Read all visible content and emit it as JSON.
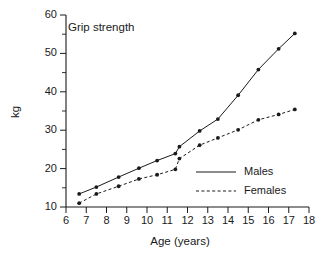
{
  "chart_data": {
    "type": "line",
    "title": "Grip strength",
    "xlabel": "Age (years)",
    "ylabel": "kg",
    "xlim": [
      6,
      18
    ],
    "ylim": [
      10,
      60
    ],
    "xticks": [
      6,
      7,
      8,
      9,
      10,
      11,
      12,
      13,
      14,
      15,
      16,
      17,
      18
    ],
    "yticks": [
      10,
      20,
      30,
      40,
      50,
      60
    ],
    "yticks_minor": [
      15,
      25,
      35,
      45,
      55
    ],
    "grid": false,
    "legend_position": "lower-right",
    "series": [
      {
        "name": "Males",
        "style": "solid",
        "x": [
          6.65,
          7.5,
          8.6,
          9.6,
          10.5,
          11.4,
          11.6,
          12.6,
          13.5,
          14.5,
          15.5,
          16.5,
          17.3
        ],
        "values": [
          13.4,
          15.2,
          17.8,
          20.1,
          22.1,
          23.9,
          25.7,
          29.8,
          32.9,
          39.1,
          45.8,
          51.2,
          55.2
        ]
      },
      {
        "name": "Females",
        "style": "dashed",
        "x": [
          6.65,
          7.5,
          8.6,
          9.6,
          10.5,
          11.4,
          11.6,
          12.6,
          13.5,
          14.5,
          15.5,
          16.5,
          17.3
        ],
        "values": [
          11.0,
          13.4,
          15.4,
          17.3,
          18.4,
          19.8,
          22.6,
          26.1,
          28.0,
          30.1,
          32.7,
          34.1,
          35.4
        ]
      }
    ],
    "legend": [
      {
        "label": "Males",
        "style": "solid"
      },
      {
        "label": "Females",
        "style": "dashed"
      }
    ],
    "colors": {
      "axis": "#1a1a1a",
      "series_males": "#1a1a1a",
      "series_females": "#1a1a1a",
      "background": "#ffffff"
    }
  }
}
